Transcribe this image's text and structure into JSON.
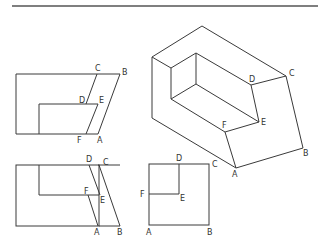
{
  "diagram": {
    "type": "orthographic-and-isometric-projection",
    "views": [
      {
        "name": "front-view",
        "labels": [
          "C",
          "B",
          "D",
          "E",
          "F",
          "A"
        ]
      },
      {
        "name": "isometric-view",
        "labels": [
          "D",
          "C",
          "F",
          "E",
          "A",
          "B"
        ]
      },
      {
        "name": "top-view",
        "labels": [
          "D",
          "C",
          "F",
          "E",
          "A",
          "B"
        ]
      },
      {
        "name": "side-view",
        "labels": [
          "D",
          "C",
          "F",
          "E",
          "A",
          "B"
        ]
      }
    ]
  },
  "labels": {
    "front": {
      "C": "C",
      "B": "B",
      "D": "D",
      "E": "E",
      "F": "F",
      "A": "A"
    },
    "iso": {
      "D": "D",
      "C": "C",
      "F": "F",
      "E": "E",
      "A": "A",
      "B": "B"
    },
    "top": {
      "D": "D",
      "C": "C",
      "F": "F",
      "E": "E",
      "A": "A",
      "B": "B"
    },
    "side": {
      "D": "D",
      "C": "C",
      "F": "F",
      "E": "E",
      "A": "A",
      "B": "B"
    }
  }
}
